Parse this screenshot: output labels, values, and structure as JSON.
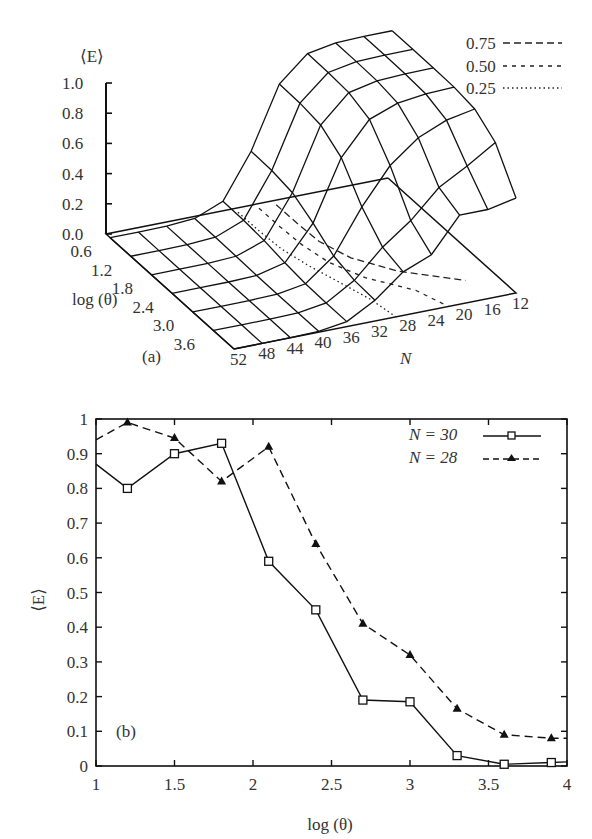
{
  "panel_a": {
    "label": "(a)",
    "zlabel": "⟨E⟩",
    "xlabel": "log (θ)",
    "ylabel": "N",
    "z_ticks": [
      "1.0",
      "0.8",
      "0.6",
      "0.4",
      "0.2",
      "0.0"
    ],
    "theta_ticks": [
      "0.6",
      "1.2",
      "1.8",
      "2.4",
      "3.0",
      "3.6"
    ],
    "n_ticks": [
      "52",
      "48",
      "44",
      "40",
      "36",
      "32",
      "28",
      "24",
      "20",
      "16",
      "12"
    ],
    "legend": [
      {
        "label": "0.75",
        "style": "long-dash"
      },
      {
        "label": "0.50",
        "style": "short-dash"
      },
      {
        "label": "0.25",
        "style": "dotted"
      }
    ]
  },
  "panel_b": {
    "label": "(b)",
    "ylabel": "⟨E⟩",
    "xlabel": "log (θ)",
    "y_ticks": [
      "0",
      "0.1",
      "0.2",
      "0.3",
      "0.4",
      "0.5",
      "0.6",
      "0.7",
      "0.8",
      "0.9",
      "1"
    ],
    "x_ticks": [
      "1",
      "1.5",
      "2",
      "2.5",
      "3",
      "3.5",
      "4"
    ],
    "legend": [
      {
        "label": "N = 30",
        "style": "solid-square"
      },
      {
        "label": "N = 28",
        "style": "dashed-triangle"
      }
    ]
  },
  "chart_data": [
    {
      "type": "surface",
      "title": "(a)",
      "xlabel": "log (θ)",
      "ylabel": "N",
      "zlabel": "⟨E⟩",
      "x": [
        0.6,
        1.2,
        1.8,
        2.4,
        3.0,
        3.6
      ],
      "y": [
        52,
        48,
        44,
        40,
        36,
        32,
        28,
        24,
        20,
        16,
        12
      ],
      "zlim": [
        0.0,
        1.0
      ],
      "contours": [
        0.75,
        0.5,
        0.25
      ],
      "description": "Wireframe surface: ⟨E⟩ near 1 for small N (12-28) at low log(θ), dropping to near 0 for large N and high log(θ); contour lines projected on base plane."
    },
    {
      "type": "line",
      "title": "(b)",
      "xlabel": "log (θ)",
      "ylabel": "⟨E⟩",
      "xlim": [
        1,
        4
      ],
      "ylim": [
        0,
        1
      ],
      "grid": false,
      "legend_position": "upper right",
      "x": [
        1.0,
        1.2,
        1.5,
        1.8,
        2.1,
        2.4,
        2.7,
        3.0,
        3.3,
        3.6,
        3.9,
        4.0
      ],
      "series": [
        {
          "name": "N = 30",
          "style": "solid, square markers",
          "values": [
            0.87,
            0.8,
            0.9,
            0.93,
            0.59,
            0.45,
            0.19,
            0.185,
            0.03,
            0.005,
            0.01,
            0.012
          ]
        },
        {
          "name": "N = 28",
          "style": "dashed, triangle markers",
          "values": [
            0.94,
            0.99,
            0.945,
            0.82,
            0.92,
            0.64,
            0.41,
            0.32,
            0.165,
            0.09,
            0.08,
            0.08
          ]
        }
      ]
    }
  ]
}
